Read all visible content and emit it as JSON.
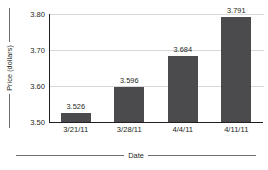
{
  "chart_data": {
    "type": "bar",
    "title": "",
    "xlabel": "Date",
    "ylabel": "Price (dollars)",
    "categories": [
      "3/21/11",
      "3/28/11",
      "4/4/11",
      "4/11/11"
    ],
    "values": [
      3.526,
      3.596,
      3.684,
      3.791
    ],
    "value_labels": [
      "3.526",
      "3.596",
      "3.684",
      "3.791"
    ],
    "ylim": [
      3.5,
      3.8
    ],
    "yticks": [
      3.5,
      3.6,
      3.7,
      3.8
    ],
    "ytick_labels": [
      "3.50",
      "3.60",
      "3.70",
      "3.80"
    ],
    "grid": true,
    "legend": false,
    "bar_color": "#4b4b4d",
    "axis_color": "#231f20",
    "gridline_color": "#d7d8d9"
  }
}
